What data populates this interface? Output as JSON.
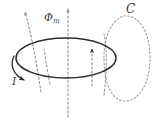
{
  "figure": {
    "background_color": "#ffffff",
    "width": 156,
    "height": 120,
    "labels": {
      "flux": "Φ",
      "flux_subscript": "m",
      "curve": "C",
      "current": "I"
    },
    "colors": {
      "loop_stroke": "#2b2b2b",
      "field_line_stroke": "#8a8a8a",
      "curve_c_stroke": "#9a9a9a",
      "label_text": "#3a3a3a"
    },
    "elements": {
      "current_loop_name": "current-loop-ellipse",
      "curve_c_name": "closed-curve-c",
      "flux_axis_name": "flux-axis-dashed-line",
      "current_arrow_name": "current-direction-arrow"
    },
    "geometry": {
      "loop_center_x": 66,
      "loop_center_y": 58,
      "loop_radius_x": 50,
      "loop_radius_y": 20,
      "flux_axis_x": 68,
      "flux_arrow_tip_y": 5,
      "curve_c_center_x": 113,
      "curve_c_center_y": 58
    }
  }
}
